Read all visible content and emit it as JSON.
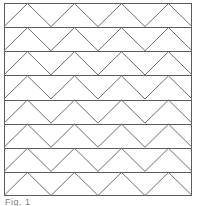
{
  "figure": {
    "caption": "Fig. 1",
    "frame": {
      "x": 4,
      "y": 3,
      "width": 188,
      "height": 193,
      "border_color": "#5c5c5c",
      "border_width": 1,
      "fill_color": "#ffffff"
    },
    "pattern": {
      "type": "banded-zigzag-tessellation",
      "band_count": 8,
      "peaks_per_band": 4,
      "zigzag_period": 47,
      "phase_offset_px": 0,
      "line_color": "#6e6e6e",
      "line_width": 1,
      "divider_color": "#5c5c5c",
      "divider_width": 1,
      "description": "Eight equal horizontal bands; each band is spanned by a continuous triangular wave whose apexes touch the band top and whose valleys touch the band bottom, producing rows of alternating up and down triangles."
    },
    "bands": [
      {
        "index": 1,
        "top": 0,
        "bottom": 24.125
      },
      {
        "index": 2,
        "top": 24.125,
        "bottom": 48.25
      },
      {
        "index": 3,
        "top": 48.25,
        "bottom": 72.375
      },
      {
        "index": 4,
        "top": 72.375,
        "bottom": 96.5
      },
      {
        "index": 5,
        "top": 96.5,
        "bottom": 120.625
      },
      {
        "index": 6,
        "top": 120.625,
        "bottom": 144.75
      },
      {
        "index": 7,
        "top": 144.75,
        "bottom": 168.875
      },
      {
        "index": 8,
        "top": 168.875,
        "bottom": 193
      }
    ]
  }
}
